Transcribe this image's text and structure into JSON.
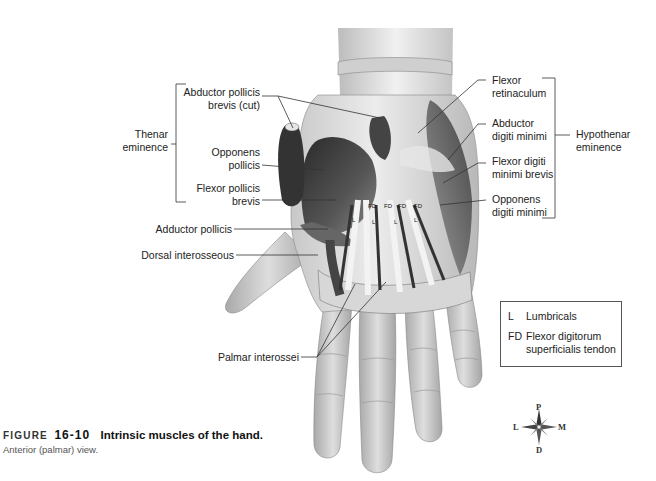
{
  "figure": {
    "label": "FIGURE",
    "number": "16-10",
    "title": "Intrinsic muscles of the hand.",
    "subtitle": "Anterior (palmar) view."
  },
  "labels_left": {
    "abductor_pollicis_brevis_cut": [
      "Abductor pollicis",
      "brevis (cut)"
    ],
    "thenar_eminence": [
      "Thenar",
      "eminence"
    ],
    "opponens_pollicis": [
      "Opponens",
      "pollicis"
    ],
    "flexor_pollicis_brevis": [
      "Flexor pollicis",
      "brevis"
    ],
    "adductor_pollicis": "Adductor pollicis",
    "dorsal_interosseous": "Dorsal interosseous",
    "palmar_interossei": "Palmar interossei"
  },
  "labels_right": {
    "flexor_retinaculum": [
      "Flexor",
      "retinaculum"
    ],
    "abductor_digiti_minimi": [
      "Abductor",
      "digiti minimi"
    ],
    "flexor_digiti_minimi_brevis": [
      "Flexor digiti",
      "minimi brevis"
    ],
    "opponens_digiti_minimi": [
      "Opponens",
      "digiti minimi"
    ],
    "hypothenar_eminence": [
      "Hypothenar",
      "eminence"
    ]
  },
  "legend": {
    "items": [
      {
        "key": "L",
        "value": "Lumbricals"
      },
      {
        "key": "FD",
        "value": "Flexor digitorum superficialis tendon",
        "lines": [
          "Flexor digitorum",
          "superficialis tendon"
        ]
      }
    ]
  },
  "compass": {
    "top": "P",
    "bottom": "D",
    "left": "L",
    "right": "M",
    "icon": "compass-rose-icon"
  },
  "colors": {
    "text": "#222222",
    "leader_line": "#333333",
    "skin_light": "#e4e4e4",
    "skin_mid": "#bdbdbd",
    "muscle_dark": "#3a3a3a",
    "tendon": "#f2f2f2"
  }
}
